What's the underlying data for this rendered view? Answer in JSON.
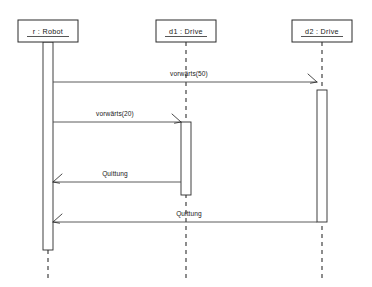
{
  "diagram": {
    "kind": "uml-sequence-diagram",
    "width": 372,
    "height": 287,
    "background": "#ffffff",
    "line_color": "#2b2b2b",
    "text_color": "#1a1a1a"
  },
  "lifelines": [
    {
      "id": "robot",
      "label": "r : Robot",
      "instance_name": "r",
      "class_name": "Robot",
      "x": 48,
      "box": {
        "x": 18,
        "y": 20,
        "width": 60,
        "height": 22
      },
      "activation": {
        "x": 43,
        "y": 42,
        "width": 10,
        "height": 208
      },
      "dash_tail": {
        "from_y": 250,
        "to_y": 278
      }
    },
    {
      "id": "d1",
      "label": "d1 : Drive",
      "instance_name": "d1",
      "class_name": "Drive",
      "x": 186,
      "box": {
        "x": 156,
        "y": 20,
        "width": 60,
        "height": 22
      },
      "activation": {
        "x": 181,
        "y": 122,
        "width": 10,
        "height": 73
      },
      "dash_tail": {
        "from_y": 42,
        "to_y": 278
      }
    },
    {
      "id": "d2",
      "label": "d2 : Drive",
      "instance_name": "d2",
      "class_name": "Drive",
      "x": 322,
      "box": {
        "x": 292,
        "y": 20,
        "width": 60,
        "height": 22
      },
      "activation": {
        "x": 317,
        "y": 90,
        "width": 10,
        "height": 132
      },
      "dash_tail": {
        "from_y": 42,
        "to_y": 278
      }
    }
  ],
  "messages": [
    {
      "id": "msg-vorwaerts-50",
      "label": "vorwärts(50)",
      "operation": "vorwärts",
      "argument": "50",
      "from": "robot",
      "to": "d2",
      "direction": "right",
      "kind": "call",
      "y": 82,
      "x_start": 53,
      "x_end": 317,
      "label_x": 189,
      "label_y": 76
    },
    {
      "id": "msg-vorwaerts-20",
      "label": "vorwärts(20)",
      "operation": "vorwärts",
      "argument": "20",
      "from": "robot",
      "to": "d1",
      "direction": "right",
      "kind": "call",
      "y": 122,
      "x_start": 53,
      "x_end": 181,
      "label_x": 115,
      "label_y": 116
    },
    {
      "id": "msg-quittung-d1",
      "label": "Quittung",
      "operation": "Quittung",
      "argument": "",
      "from": "d1",
      "to": "robot",
      "direction": "left",
      "kind": "return",
      "y": 182,
      "x_start": 181,
      "x_end": 53,
      "label_x": 115,
      "label_y": 176
    },
    {
      "id": "msg-quittung-d2",
      "label": "Quittung",
      "operation": "Quittung",
      "argument": "",
      "from": "d2",
      "to": "robot",
      "direction": "left",
      "kind": "return",
      "y": 222,
      "x_start": 317,
      "x_end": 53,
      "label_x": 189,
      "label_y": 216
    }
  ]
}
